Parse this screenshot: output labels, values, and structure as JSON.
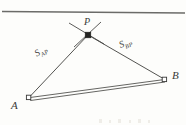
{
  "figure": {
    "kind": "trilateration-diagram",
    "background_color": "#fdfdfb",
    "ink_color": "#3a3a38",
    "width": 186,
    "height": 125,
    "top_rule": {
      "name": "horizontal-rule",
      "x1": 2,
      "y1": 11,
      "x2": 185,
      "y2": 13,
      "color": "#6b6b68"
    },
    "labels": {
      "station_a": "A",
      "station_b": "B",
      "point_p": "P",
      "distance_ap_symbol": "S",
      "distance_ap_subscript": "AP",
      "distance_bp_symbol": "S",
      "distance_bp_subscript": "BP"
    },
    "points": {
      "A": {
        "x": 29,
        "y": 98,
        "marker": "open-square"
      },
      "B": {
        "x": 164,
        "y": 79,
        "marker": "open-square"
      },
      "P": {
        "x": 88,
        "y": 35,
        "marker": "filled-square"
      }
    },
    "lines": [
      {
        "name": "line-ap",
        "from": "A",
        "to": "P",
        "style": "solid"
      },
      {
        "name": "line-bp",
        "from": "B",
        "to": "P",
        "style": "solid"
      },
      {
        "name": "baseline-ab",
        "from": "A",
        "to": "B",
        "style": "double-rail"
      }
    ],
    "ray_through_p": {
      "name": "intersection-rays",
      "ray_1": {
        "x1": 69,
        "y1": 23,
        "x2": 104,
        "y2": 44
      },
      "ray_2": {
        "x1": 101,
        "y1": 22,
        "x2": 74,
        "y2": 47
      }
    },
    "scan_artifacts": [
      {
        "x": 99,
        "y": 119,
        "w": 3,
        "h": 4
      },
      {
        "x": 109,
        "y": 120,
        "w": 2,
        "h": 3
      },
      {
        "x": 118,
        "y": 119,
        "w": 3,
        "h": 4
      },
      {
        "x": 129,
        "y": 120,
        "w": 2,
        "h": 3
      },
      {
        "x": 138,
        "y": 119,
        "w": 3,
        "h": 4
      },
      {
        "x": 148,
        "y": 120,
        "w": 2,
        "h": 3
      }
    ]
  }
}
